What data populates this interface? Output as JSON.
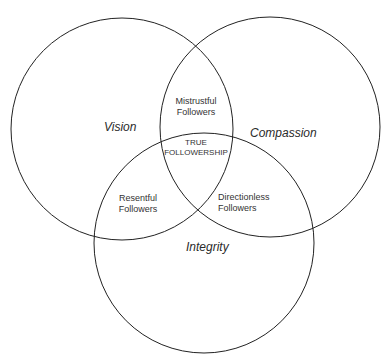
{
  "diagram": {
    "type": "venn",
    "sets": [
      {
        "id": "vision",
        "label": "Vision"
      },
      {
        "id": "compassion",
        "label": "Compassion"
      },
      {
        "id": "integrity",
        "label": "Integrity"
      }
    ],
    "regions": {
      "vision_compassion": {
        "line1": "Mistrustful",
        "line2": "Followers"
      },
      "all_three": {
        "line1": "TRUE",
        "line2": "FOLLOWERSHIP"
      },
      "vision_integrity": {
        "line1": "Resentful",
        "line2": "Followers"
      },
      "compassion_integrity": {
        "line1": "Directionless",
        "line2": "Followers"
      }
    },
    "stroke_color": "#222222"
  }
}
